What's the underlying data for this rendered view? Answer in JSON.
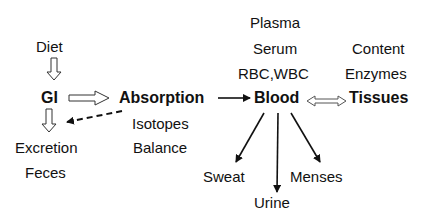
{
  "nodes": {
    "diet": "Diet",
    "gi": "GI",
    "excretion": "Excretion",
    "feces": "Feces",
    "absorption": "Absorption",
    "isotopes": "Isotopes",
    "balance": "Balance",
    "plasma": "Plasma",
    "serum": "Serum",
    "rbc_wbc": "RBC,WBC",
    "blood": "Blood",
    "content": "Content",
    "enzymes": "Enzymes",
    "tissues": "Tissues",
    "sweat": "Sweat",
    "urine": "Urine",
    "menses": "Menses"
  },
  "edges": [
    {
      "from": "Diet",
      "to": "GI",
      "style": "hollow"
    },
    {
      "from": "GI",
      "to": "Absorption",
      "style": "hollow"
    },
    {
      "from": "GI",
      "to": "Excretion",
      "style": "hollow"
    },
    {
      "from": "Absorption",
      "to": "Excretion",
      "style": "dashed"
    },
    {
      "from": "Absorption",
      "to": "Blood",
      "style": "solid"
    },
    {
      "from": "Blood",
      "to": "Tissues",
      "style": "hollow-double"
    },
    {
      "from": "Blood",
      "to": "Sweat",
      "style": "solid"
    },
    {
      "from": "Blood",
      "to": "Urine",
      "style": "solid"
    },
    {
      "from": "Blood",
      "to": "Menses",
      "style": "solid"
    }
  ]
}
